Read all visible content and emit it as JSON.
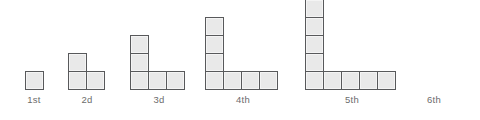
{
  "figure": {
    "background_color": "#ffffff",
    "tile": {
      "fill_color": "#e9e9e9",
      "border_color": "#58595b",
      "size_px": 19
    },
    "label_color": "#6c6c6c",
    "baseline_y_px": 71,
    "terms": [
      {
        "label": "1st",
        "term_number": 1,
        "column_height": 1,
        "row_length": 1,
        "total_squares": 1,
        "drawn": true,
        "left_px": 25,
        "label_center_px": 34
      },
      {
        "label": "2d",
        "term_number": 2,
        "column_height": 2,
        "row_length": 2,
        "total_squares": 3,
        "drawn": true,
        "left_px": 68,
        "label_center_px": 87
      },
      {
        "label": "3d",
        "term_number": 3,
        "column_height": 3,
        "row_length": 3,
        "total_squares": 5,
        "drawn": true,
        "left_px": 130,
        "label_center_px": 159
      },
      {
        "label": "4th",
        "term_number": 4,
        "column_height": 4,
        "row_length": 4,
        "total_squares": 7,
        "drawn": true,
        "left_px": 205,
        "label_center_px": 243
      },
      {
        "label": "5th",
        "term_number": 5,
        "column_height": 5,
        "row_length": 5,
        "total_squares": 9,
        "drawn": true,
        "left_px": 305,
        "label_center_px": 352
      },
      {
        "label": "6th",
        "term_number": 6,
        "column_height": 6,
        "row_length": 6,
        "total_squares": 11,
        "drawn": false,
        "left_px": 425,
        "label_center_px": 434
      }
    ]
  }
}
